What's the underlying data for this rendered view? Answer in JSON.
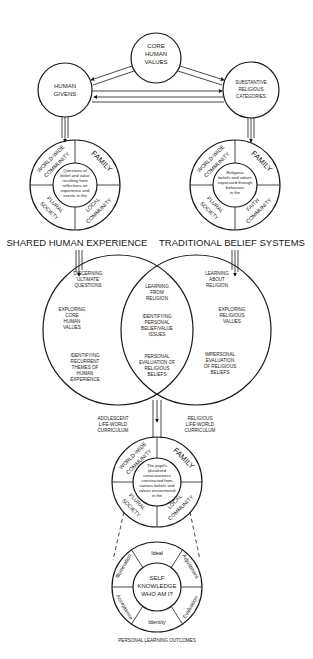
{
  "diagram": {
    "top": {
      "core_values": [
        "CORE",
        "HUMAN",
        "VALUES"
      ],
      "human_givens": [
        "HUMAN",
        "GIVENS"
      ],
      "substantive": [
        "SUBSTANTIVE",
        "RELIGIOUS",
        "CATEGORIES"
      ]
    },
    "left_ring": {
      "segments": {
        "top_left": [
          "WORLD-WIDE",
          "COMMUNITY"
        ],
        "top_right": "FAMILY",
        "bottom_left": [
          "PLURAL",
          "SOCIETY"
        ],
        "bottom_right": [
          "LOCAL",
          "COMMUNITY"
        ]
      },
      "center": [
        "Questions of",
        "belief and value",
        "resulting from",
        "reflections on",
        "experience and",
        "events in the",
        "..."
      ]
    },
    "right_ring": {
      "segments": {
        "top_left": [
          "WORLD-WIDE",
          "COMMUNITY"
        ],
        "top_right": "FAMILY",
        "bottom_left": [
          "PLURAL",
          "SOCIETY"
        ],
        "bottom_right": [
          "FAITH",
          "COMMUNITY"
        ]
      },
      "center": [
        "Religious",
        "beliefs and values",
        "expressed through",
        "behaviour",
        "in the",
        "..."
      ]
    },
    "section_labels": {
      "left": "SHARED HUMAN EXPERIENCE",
      "right": "TRADITIONAL BELIEF SYSTEMS"
    },
    "venn": {
      "left": [
        [
          "DISCERNING",
          "'ULTIMATE'",
          "QUESTIONS"
        ],
        [
          "EXPLORING",
          "CORE",
          "HUMAN",
          "VALUES"
        ],
        [
          "IDENTIFYING",
          "RECURRENT",
          "THEMES OF",
          "HUMAN",
          "EXPERIENCE"
        ]
      ],
      "middle": [
        [
          "LEARNING",
          "FROM",
          "RELIGION"
        ],
        [
          "IDENTIFYING",
          "PERSONAL",
          "BELIEF/VALUE",
          "ISSUES"
        ],
        [
          "PERSONAL",
          "EVALUATION OF",
          "RELIGIOUS",
          "BELIEFS"
        ]
      ],
      "right": [
        [
          "LEARNING",
          "ABOUT",
          "RELIGION"
        ],
        [
          "EXPLORING",
          "RELIGIOUS",
          "VALUES"
        ],
        [
          "IMPERSONAL",
          "EVALUATION",
          "OF RELIGIOUS",
          "BELIEFS"
        ]
      ]
    },
    "curricula": {
      "left": [
        "ADOLESCENT",
        "LIFE-WORLD",
        "CURRICULUM"
      ],
      "right": [
        "RELIGIOUS",
        "LIFE-WORLD",
        "CURRICULUM"
      ]
    },
    "pupil_ring": {
      "segments": {
        "top_left": [
          "WORLD-WIDE",
          "COMMUNITY"
        ],
        "top_right": "FAMILY",
        "bottom_left": [
          "PLURAL",
          "SOCIETY"
        ],
        "bottom_right": [
          "LOCAL",
          "COMMUNITY"
        ]
      },
      "center": [
        "The pupil's",
        "pluralised",
        "consciousness",
        "constructed from",
        "various beliefs and",
        "values encountered",
        "in the"
      ]
    },
    "self_ring": {
      "segments": [
        "Ideal",
        "Adjustment",
        "Evaluation",
        "Identity",
        "Acceptance",
        "Illumination"
      ],
      "center": [
        "SELF",
        "KNOWLEDGE",
        "WHO AM I?"
      ]
    },
    "footer": "PERSONAL LEARNING OUTCOMES"
  }
}
